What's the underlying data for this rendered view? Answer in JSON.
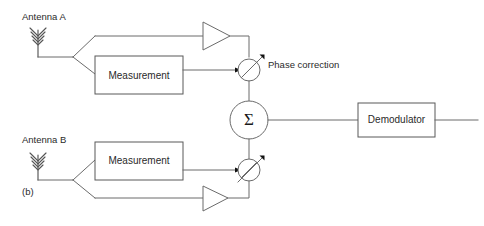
{
  "figure": {
    "sublabel": "(b)",
    "background_color": "#ffffff",
    "line_color": "#6b6b6b",
    "text_color": "#2a2a2a"
  },
  "antennas": [
    {
      "id": "antenna-a",
      "label": "Antenna A",
      "icon": "antenna-icon"
    },
    {
      "id": "antenna-b",
      "label": "Antenna B",
      "icon": "antenna-icon"
    }
  ],
  "blocks": {
    "measurement_top": {
      "label": "Measurement"
    },
    "measurement_bottom": {
      "label": "Measurement"
    },
    "demodulator": {
      "label": "Demodulator"
    }
  },
  "nodes": {
    "summer": {
      "label": "Σ",
      "name": "summing-junction"
    },
    "phase_shifter_top": {
      "icon": "phase-shifter-icon",
      "annotation": "Phase correction"
    },
    "phase_shifter_bottom": {
      "icon": "phase-shifter-icon",
      "annotation": ""
    }
  },
  "amplifiers": [
    {
      "id": "amplifier-top",
      "icon": "amplifier-icon"
    },
    {
      "id": "amplifier-bottom",
      "icon": "amplifier-icon"
    }
  ],
  "annotations": {
    "phase_correction": "Phase correction"
  }
}
